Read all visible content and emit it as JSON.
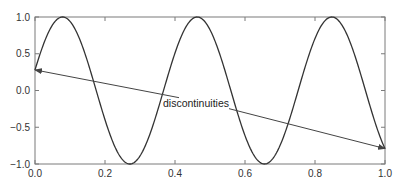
{
  "chart_data": {
    "type": "line",
    "title": "",
    "xlabel": "",
    "ylabel": "",
    "xlim": [
      0.0,
      1.0
    ],
    "ylim": [
      -1.0,
      1.0
    ],
    "grid": false,
    "legend": null,
    "xticks": [
      0.0,
      0.2,
      0.4,
      0.6,
      0.8,
      1.0
    ],
    "xtick_labels": [
      "0.0",
      "0.2",
      "0.4",
      "0.6",
      "0.8",
      "1.0"
    ],
    "yticks": [
      1.0,
      0.5,
      0.0,
      -0.5,
      -1.0
    ],
    "ytick_labels": [
      "1.0",
      "0.5",
      "0.0",
      "−0.5",
      "−1.0"
    ],
    "series": [
      {
        "name": "signal",
        "function": "sin(2*pi*2.6*x + 0.284)",
        "frequency": 2.6,
        "phase": 0.284,
        "x": [
          0.0,
          0.08,
          0.27,
          0.47,
          0.66,
          0.85,
          1.0
        ],
        "values": [
          0.28,
          1.0,
          -1.0,
          1.0,
          -1.0,
          1.0,
          -0.79
        ],
        "color": "#333333"
      }
    ],
    "annotations": [
      {
        "text": "discontinuities",
        "text_position": [
          0.46,
          -0.22
        ],
        "arrows_to": [
          [
            0.0,
            0.28
          ],
          [
            1.0,
            -0.79
          ]
        ]
      }
    ]
  },
  "colors": {
    "axis": "#7a7a7a",
    "curve": "#333333",
    "arrow": "#444444",
    "text": "#333333"
  }
}
